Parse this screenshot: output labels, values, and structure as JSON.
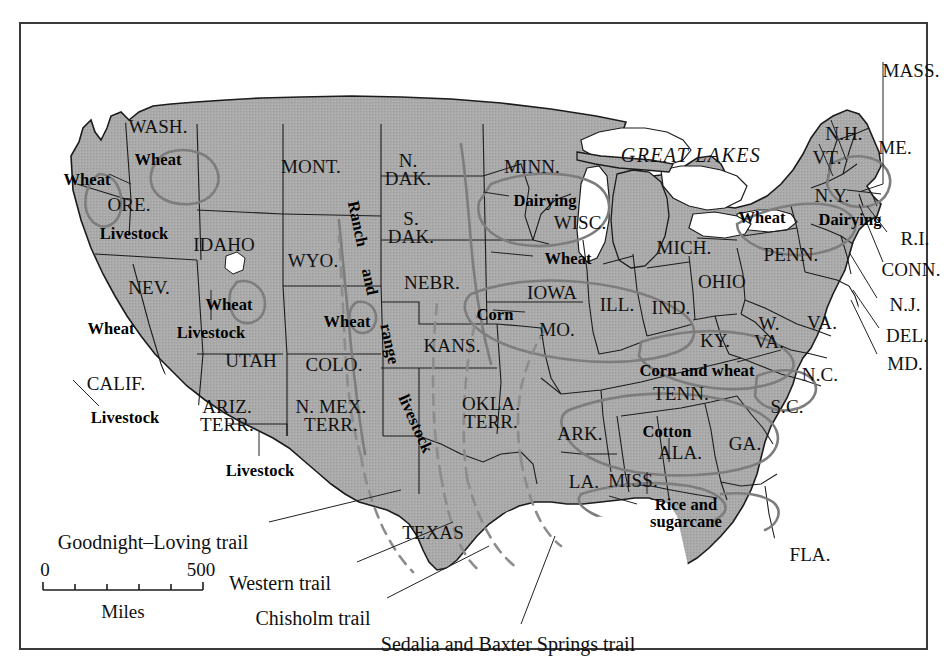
{
  "figure": {
    "frame_border_color": "#3a3a3a",
    "land_fill_color": "#a9a9a9",
    "water_fill_color": "#ffffff",
    "state_border_color": "#1a1a1a",
    "crop_region_color": "#7b7b7b",
    "trail_color": "#8a8a8a",
    "background_color": "#ffffff"
  },
  "great_lakes_label": "GREAT LAKES",
  "states": [
    {
      "name": "WASH.",
      "lines": [
        "WASH."
      ],
      "x": 137,
      "y": 103
    },
    {
      "name": "ORE.",
      "lines": [
        "ORE."
      ],
      "x": 108,
      "y": 181
    },
    {
      "name": "IDAHO",
      "lines": [
        "IDAHO"
      ],
      "x": 203,
      "y": 221
    },
    {
      "name": "MONT.",
      "lines": [
        "MONT."
      ],
      "x": 290,
      "y": 143
    },
    {
      "name": "N. DAK.",
      "lines": [
        "N.",
        "DAK."
      ],
      "x": 387,
      "y": 146
    },
    {
      "name": "S. DAK.",
      "lines": [
        "S.",
        "DAK."
      ],
      "x": 390,
      "y": 204
    },
    {
      "name": "MINN.",
      "lines": [
        "MINN."
      ],
      "x": 511,
      "y": 143
    },
    {
      "name": "WISC.",
      "lines": [
        "WISC."
      ],
      "x": 559,
      "y": 199
    },
    {
      "name": "MICH.",
      "lines": [
        "MICH."
      ],
      "x": 663,
      "y": 224
    },
    {
      "name": "WYO.",
      "lines": [
        "WYO."
      ],
      "x": 292,
      "y": 237
    },
    {
      "name": "NEBR.",
      "lines": [
        "NEBR."
      ],
      "x": 411,
      "y": 259
    },
    {
      "name": "IOWA",
      "lines": [
        "IOWA"
      ],
      "x": 531,
      "y": 269
    },
    {
      "name": "ILL.",
      "lines": [
        "ILL."
      ],
      "x": 596,
      "y": 281
    },
    {
      "name": "IND.",
      "lines": [
        "IND."
      ],
      "x": 650,
      "y": 284
    },
    {
      "name": "OHIO",
      "lines": [
        "OHIO"
      ],
      "x": 701,
      "y": 258
    },
    {
      "name": "PENN.",
      "lines": [
        "PENN."
      ],
      "x": 770,
      "y": 231
    },
    {
      "name": "N.Y.",
      "lines": [
        "N.Y."
      ],
      "x": 811,
      "y": 172
    },
    {
      "name": "VT.",
      "lines": [
        "VT."
      ],
      "x": 806,
      "y": 134
    },
    {
      "name": "N.H.",
      "lines": [
        "N.H."
      ],
      "x": 823,
      "y": 110
    },
    {
      "name": "ME.",
      "lines": [
        "ME."
      ],
      "x": 874,
      "y": 124
    },
    {
      "name": "MASS.",
      "lines": [
        "MASS."
      ],
      "x": 890,
      "y": 47
    },
    {
      "name": "R.I.",
      "lines": [
        "R.I."
      ],
      "x": 894,
      "y": 215
    },
    {
      "name": "CONN.",
      "lines": [
        "CONN."
      ],
      "x": 890,
      "y": 246
    },
    {
      "name": "N.J.",
      "lines": [
        "N.J."
      ],
      "x": 884,
      "y": 281
    },
    {
      "name": "DEL.",
      "lines": [
        "DEL."
      ],
      "x": 886,
      "y": 312
    },
    {
      "name": "MD.",
      "lines": [
        "MD."
      ],
      "x": 884,
      "y": 340
    },
    {
      "name": "NEV.",
      "lines": [
        "NEV."
      ],
      "x": 128,
      "y": 264
    },
    {
      "name": "UTAH",
      "lines": [
        "UTAH"
      ],
      "x": 230,
      "y": 337
    },
    {
      "name": "COLO.",
      "lines": [
        "COLO."
      ],
      "x": 313,
      "y": 341
    },
    {
      "name": "KANS.",
      "lines": [
        "KANS."
      ],
      "x": 431,
      "y": 322
    },
    {
      "name": "MO.",
      "lines": [
        "MO."
      ],
      "x": 536,
      "y": 306
    },
    {
      "name": "KY.",
      "lines": [
        "KY."
      ],
      "x": 694,
      "y": 317
    },
    {
      "name": "W. VA.",
      "lines": [
        "W.",
        "VA."
      ],
      "x": 748,
      "y": 309
    },
    {
      "name": "VA.",
      "lines": [
        "VA."
      ],
      "x": 801,
      "y": 299
    },
    {
      "name": "CALIF.",
      "lines": [
        "CALIF."
      ],
      "x": 95,
      "y": 360
    },
    {
      "name": "ARIZ. TERR.",
      "lines": [
        "ARIZ.",
        "TERR."
      ],
      "x": 206,
      "y": 392
    },
    {
      "name": "N. MEX. TERR.",
      "lines": [
        "N. MEX.",
        "TERR."
      ],
      "x": 310,
      "y": 392
    },
    {
      "name": "OKLA. TERR.",
      "lines": [
        "OKLA.",
        "TERR."
      ],
      "x": 470,
      "y": 389
    },
    {
      "name": "ARK.",
      "lines": [
        "ARK."
      ],
      "x": 559,
      "y": 410
    },
    {
      "name": "TENN.",
      "lines": [
        "TENN."
      ],
      "x": 660,
      "y": 370
    },
    {
      "name": "N.C.",
      "lines": [
        "N.C."
      ],
      "x": 799,
      "y": 351
    },
    {
      "name": "S.C.",
      "lines": [
        "S.C."
      ],
      "x": 766,
      "y": 383
    },
    {
      "name": "GA.",
      "lines": [
        "GA."
      ],
      "x": 724,
      "y": 420
    },
    {
      "name": "ALA.",
      "lines": [
        "ALA."
      ],
      "x": 659,
      "y": 429
    },
    {
      "name": "MISS.",
      "lines": [
        "MISS."
      ],
      "x": 612,
      "y": 457
    },
    {
      "name": "LA.",
      "lines": [
        "LA."
      ],
      "x": 563,
      "y": 458
    },
    {
      "name": "TEXAS",
      "lines": [
        "TEXAS"
      ],
      "x": 412,
      "y": 509
    },
    {
      "name": "FLA.",
      "lines": [
        "FLA."
      ],
      "x": 789,
      "y": 531
    }
  ],
  "crop_labels": [
    {
      "text": "Wheat",
      "lines": [
        "Wheat"
      ],
      "x": 66,
      "y": 156
    },
    {
      "text": "Wheat",
      "lines": [
        "Wheat"
      ],
      "x": 137,
      "y": 136
    },
    {
      "text": "Livestock",
      "lines": [
        "Livestock"
      ],
      "x": 113,
      "y": 210
    },
    {
      "text": "Wheat",
      "lines": [
        "Wheat"
      ],
      "x": 90,
      "y": 305
    },
    {
      "text": "Wheat",
      "lines": [
        "Wheat"
      ],
      "x": 208,
      "y": 281
    },
    {
      "text": "Livestock",
      "lines": [
        "Livestock"
      ],
      "x": 190,
      "y": 309
    },
    {
      "text": "Livestock",
      "lines": [
        "Livestock"
      ],
      "x": 104,
      "y": 394
    },
    {
      "text": "Livestock",
      "lines": [
        "Livestock"
      ],
      "x": 239,
      "y": 447
    },
    {
      "text": "Wheat",
      "lines": [
        "Wheat"
      ],
      "x": 326,
      "y": 298
    },
    {
      "text": "Dairying",
      "lines": [
        "Dairying"
      ],
      "x": 524,
      "y": 177
    },
    {
      "text": "Wheat",
      "lines": [
        "Wheat"
      ],
      "x": 547,
      "y": 235
    },
    {
      "text": "Corn",
      "lines": [
        "Corn"
      ],
      "x": 474,
      "y": 291
    },
    {
      "text": "Wheat",
      "lines": [
        "Wheat"
      ],
      "x": 741,
      "y": 194
    },
    {
      "text": "Dairying",
      "lines": [
        "Dairying"
      ],
      "x": 829,
      "y": 196
    },
    {
      "text": "Corn and wheat",
      "lines": [
        "Corn and wheat"
      ],
      "x": 676,
      "y": 347
    },
    {
      "text": "Cotton",
      "lines": [
        "Cotton"
      ],
      "x": 646,
      "y": 408
    },
    {
      "text": "Rice and sugarcane",
      "lines": [
        "Rice and",
        "sugarcane"
      ],
      "x": 665,
      "y": 489
    }
  ],
  "ranch_range_label": {
    "segments": [
      "Ranch",
      "and",
      "range",
      "livestock"
    ],
    "full_text": "Ranch and range livestock"
  },
  "trails": [
    {
      "label": "Goodnight–Loving trail",
      "label_x": 132,
      "label_y": 518,
      "anchor_x": 390,
      "anchor_y": 478
    },
    {
      "label": "Western trail",
      "label_x": 259,
      "label_y": 559,
      "anchor_x": 441,
      "anchor_y": 508
    },
    {
      "label": "Chisholm trail",
      "label_x": 292,
      "label_y": 594,
      "anchor_x": 478,
      "anchor_y": 533
    },
    {
      "label": "Sedalia and Baxter Springs trail",
      "label_x": 487,
      "label_y": 620,
      "anchor_x": 536,
      "anchor_y": 520
    }
  ],
  "scale_bar": {
    "start_label": "0",
    "end_label": "500",
    "unit_label": "Miles",
    "divisions": 5
  }
}
